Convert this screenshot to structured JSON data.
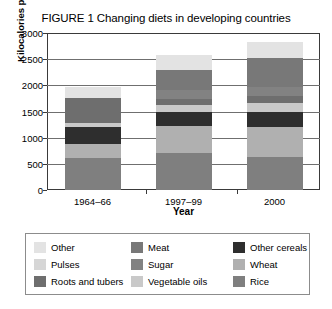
{
  "figure": {
    "title": "FIGURE 1 Changing diets in developing countries"
  },
  "chart_data": {
    "type": "bar",
    "subtype": "stacked",
    "title": "FIGURE 1 Changing diets in developing countries",
    "xlabel": "Year",
    "ylabel": "Kilocalories per capita per day",
    "categories": [
      "1964–66",
      "1997–99",
      "2000"
    ],
    "ylim": [
      0,
      3000
    ],
    "yticks": [
      0,
      500,
      1000,
      1500,
      2000,
      2500,
      3000
    ],
    "ytick_labels": [
      "0",
      "500",
      "1000",
      "1500",
      "2000",
      "2500",
      "3000"
    ],
    "grid": true,
    "legend_position": "below",
    "series": [
      {
        "name": "Rice",
        "color": "#7f7f7f",
        "values": [
          610,
          710,
          630
        ]
      },
      {
        "name": "Wheat",
        "color": "#b0b0b0",
        "values": [
          270,
          510,
          570
        ]
      },
      {
        "name": "Other cereals",
        "color": "#2e2e2e",
        "values": [
          320,
          270,
          300
        ]
      },
      {
        "name": "Vegetable oils",
        "color": "#c9c9c9",
        "values": [
          80,
          130,
          160
        ]
      },
      {
        "name": "Roots and tubers",
        "color": "#6e6e6e",
        "values": [
          470,
          120,
          130
        ]
      },
      {
        "name": "Sugar",
        "color": "#828282",
        "values": [
          0,
          180,
          170
        ]
      },
      {
        "name": "Meat",
        "color": "#787878",
        "values": [
          0,
          380,
          570
        ]
      },
      {
        "name": "Pulses",
        "color": "#d6d6d6",
        "values": [
          0,
          0,
          0
        ]
      },
      {
        "name": "Other",
        "color": "#e3e3e3",
        "values": [
          210,
          280,
          300
        ]
      }
    ],
    "totals": [
      1960,
      2580,
      2830
    ],
    "stack_order_bottom_to_top": [
      "Rice",
      "Wheat",
      "Other cereals",
      "Vegetable oils",
      "Roots and tubers",
      "Sugar",
      "Meat",
      "Pulses",
      "Other"
    ]
  },
  "legend": {
    "items": [
      {
        "label": "Other",
        "color": "#e3e3e3"
      },
      {
        "label": "Meat",
        "color": "#787878"
      },
      {
        "label": "Other cereals",
        "color": "#2e2e2e"
      },
      {
        "label": "Pulses",
        "color": "#d6d6d6"
      },
      {
        "label": "Sugar",
        "color": "#828282"
      },
      {
        "label": "Wheat",
        "color": "#b0b0b0"
      },
      {
        "label": "Roots and tubers",
        "color": "#6e6e6e"
      },
      {
        "label": "Vegetable oils",
        "color": "#c9c9c9"
      },
      {
        "label": "Rice",
        "color": "#7f7f7f"
      }
    ]
  }
}
